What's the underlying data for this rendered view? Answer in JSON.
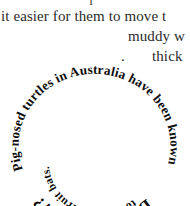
{
  "page": {
    "background_color": "#ffffff",
    "text_color": "#2b2b2b"
  },
  "body_text": {
    "clipped_top_fragment": "l",
    "line_1": "it easier for them to move t",
    "line_2": "muddy w",
    "line_3_lead": ".",
    "line_3": "thick"
  },
  "badge": {
    "title": "Did you know?",
    "fact_full": "Pig-nosed turtles in Australia have been known to eat giant fruit bats.",
    "outer_ring_text": "Pig-nosed turtles in Australia have been known",
    "inner_ring_text": "to eat giant fruit bats.",
    "text_color": "#0d0d0d"
  }
}
